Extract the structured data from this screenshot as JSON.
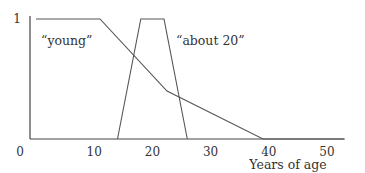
{
  "chart_data": {
    "type": "line",
    "title": "",
    "xlabel": "Years of age",
    "ylabel": "",
    "xlim": [
      0,
      53
    ],
    "ylim": [
      0,
      1
    ],
    "x_ticks": [
      0,
      10,
      20,
      30,
      40,
      50
    ],
    "y_ticks": [
      1
    ],
    "grid": false,
    "legend": null,
    "series": [
      {
        "name": "young",
        "label": "“young”",
        "points": [
          [
            0,
            1
          ],
          [
            11,
            1
          ],
          [
            22.5,
            0.4
          ],
          [
            39,
            0
          ],
          [
            53,
            0
          ]
        ]
      },
      {
        "name": "about 20",
        "label": "“about 20”",
        "points": [
          [
            14,
            0
          ],
          [
            18,
            1
          ],
          [
            22,
            1
          ],
          [
            26,
            0
          ]
        ]
      }
    ],
    "annotations": [
      {
        "text": "“young”",
        "x": 3,
        "y": 0.75
      },
      {
        "text": "“about 20”",
        "x": 24,
        "y": 0.75
      }
    ]
  },
  "colors": {
    "line": "#555555",
    "axis": "#444444",
    "text": "#333333"
  }
}
